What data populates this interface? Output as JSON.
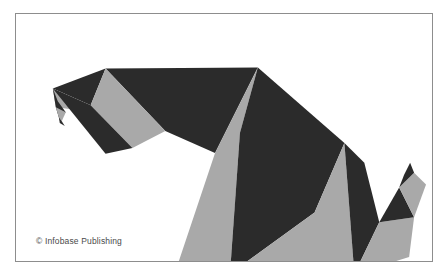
{
  "figure": {
    "credit": "© Infobase Publishing",
    "background_color": "#ffffff",
    "frame": {
      "border_color": "#8d8d8d",
      "border_width_px": 1,
      "x": 15,
      "y": 13,
      "width": 418,
      "height": 249
    },
    "palette": {
      "dark": "#2b2b2b",
      "gray": "#a9a9a9",
      "white": "#ffffff"
    },
    "viewbox": "0 0 418 249",
    "parts": [
      {
        "name": "beak-upper-dark",
        "label": "Upper beak (dark)",
        "fill": "dark",
        "points": "37,75 90,55 75,92"
      },
      {
        "name": "beak-notch-gray",
        "label": "Beak notch (gray)",
        "fill": "gray",
        "points": "37,75 75,92 79,99 40,94"
      },
      {
        "name": "beak-lower-dark",
        "label": "Lower beak hook (dark)",
        "fill": "dark",
        "points": "37,75 40,94 43,104 50,99 42,88"
      },
      {
        "name": "beak-tip-gray",
        "label": "Beak tip sliver (gray)",
        "fill": "gray",
        "points": "40,94 50,99 46,108 43,104"
      },
      {
        "name": "beak-tip-dark",
        "label": "Beak tip point (dark)",
        "fill": "dark",
        "points": "43,104 46,108 49,113 44,110"
      },
      {
        "name": "head-crown-dark",
        "label": "Head crown (dark)",
        "fill": "dark",
        "points": "90,55 243,54 200,140 150,118"
      },
      {
        "name": "head-back-gray",
        "label": "Head back (gray)",
        "fill": "gray",
        "points": "90,55 150,118 117,135 75,92"
      },
      {
        "name": "nape-dark",
        "label": "Nape wedge (dark)",
        "fill": "dark",
        "points": "75,92 117,135 90,141 37,75"
      },
      {
        "name": "breast-gray",
        "label": "Breast panel (gray)",
        "fill": "gray",
        "points": "243,54 200,140 160,260 215,262 225,120"
      },
      {
        "name": "body-upper-dark",
        "label": "Body / wing upper (dark)",
        "fill": "dark",
        "points": "243,54 330,130 300,200 215,262 225,120"
      },
      {
        "name": "wing-lower-gray",
        "label": "Lower wing panel (gray)",
        "fill": "gray",
        "points": "300,200 215,262 340,262 330,130"
      },
      {
        "name": "wing-tip-dark",
        "label": "Wing tip (dark)",
        "fill": "dark",
        "points": "330,130 340,262 365,210 350,150"
      },
      {
        "name": "tail-base-gray",
        "label": "Tail base (gray)",
        "fill": "gray",
        "points": "340,262 365,210 400,205 395,245"
      },
      {
        "name": "tail-mid-dark",
        "label": "Tail mid (dark)",
        "fill": "dark",
        "points": "365,210 400,205 385,175"
      },
      {
        "name": "tail-upper-gray",
        "label": "Tail upper (gray)",
        "fill": "gray",
        "points": "385,175 400,205 412,172 400,160"
      },
      {
        "name": "tail-tip-dark",
        "label": "Tail tip (dark)",
        "fill": "dark",
        "points": "385,175 400,160 396,150 390,162"
      }
    ]
  }
}
